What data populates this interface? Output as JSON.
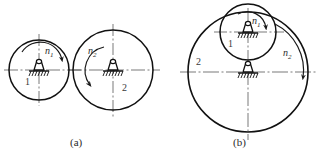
{
  "figure": {
    "width": 318,
    "height": 157,
    "background_color": "#ffffff",
    "line_color": "#1a1a1a",
    "centerline_color": "#4a4a4a"
  },
  "panels": [
    {
      "id": "a",
      "caption": "(a)",
      "caption_x": 70,
      "caption_y": 138,
      "description": "external contact friction wheels",
      "wheels": [
        {
          "name": "wheel-1",
          "number_label": "1",
          "number_x": 28,
          "number_y": 82,
          "cx": 39,
          "cy": 70,
          "r": 30,
          "speed_label": "n",
          "speed_sub": "1",
          "speed_label_x": 45,
          "speed_label_y": 51,
          "rotation": "clockwise"
        },
        {
          "name": "wheel-2",
          "number_label": "2",
          "number_x": 124,
          "number_y": 88,
          "cx": 113,
          "cy": 70,
          "r": 40,
          "speed_label": "n",
          "speed_sub": "2",
          "speed_label_x": 88,
          "speed_label_y": 51,
          "rotation": "counterclockwise"
        }
      ]
    },
    {
      "id": "b",
      "caption": "(b)",
      "caption_x": 233,
      "caption_y": 138,
      "description": "internal contact friction wheels",
      "wheels": [
        {
          "name": "wheel-1",
          "number_label": "1",
          "number_x": 230,
          "number_y": 43,
          "cx": 248,
          "cy": 32,
          "r": 28,
          "speed_label": "n",
          "speed_sub": "1",
          "speed_label_x": 252,
          "speed_label_y": 21,
          "rotation": "clockwise"
        },
        {
          "name": "wheel-2",
          "number_label": "2",
          "number_x": 197,
          "number_y": 62,
          "cx": 248,
          "cy": 72,
          "r": 60,
          "speed_label": "n",
          "speed_sub": "2",
          "speed_label_x": 283,
          "speed_label_y": 53,
          "rotation": "clockwise"
        }
      ]
    }
  ],
  "supports": [
    {
      "name": "support-a1",
      "x": 39,
      "y": 70
    },
    {
      "name": "support-a2",
      "x": 113,
      "y": 70
    },
    {
      "name": "support-b1",
      "x": 248,
      "y": 32
    },
    {
      "name": "support-b2",
      "x": 248,
      "y": 72
    }
  ]
}
